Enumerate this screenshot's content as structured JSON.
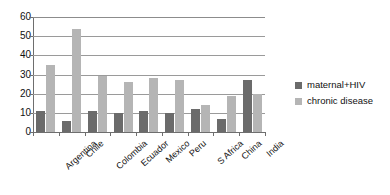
{
  "chart_data": {
    "type": "bar",
    "title": "",
    "xlabel": "",
    "ylabel": "",
    "ylim": [
      0,
      60
    ],
    "yticks": [
      0,
      10,
      20,
      30,
      40,
      50,
      60
    ],
    "grid": true,
    "legend_position": "right",
    "categories": [
      "Argentina",
      "Chile",
      "Colombia",
      "Ecuador",
      "Mexico",
      "Peru",
      "S Africa",
      "China",
      "India"
    ],
    "series": [
      {
        "name": "maternal+HIV",
        "color": "#6b6b6b",
        "values": [
          11,
          6,
          11,
          10,
          11,
          10,
          12,
          7,
          27
        ]
      },
      {
        "name": "chronic disease",
        "color": "#b5b5b5",
        "values": [
          35,
          54,
          29,
          26,
          28,
          27,
          14,
          19,
          20
        ]
      }
    ]
  },
  "axis": {
    "y_tick_labels": [
      "60",
      "50",
      "40",
      "30",
      "20",
      "10",
      "0"
    ]
  },
  "legend": {
    "items": [
      {
        "label": "maternal+HIV"
      },
      {
        "label": "chronic disease"
      }
    ]
  }
}
